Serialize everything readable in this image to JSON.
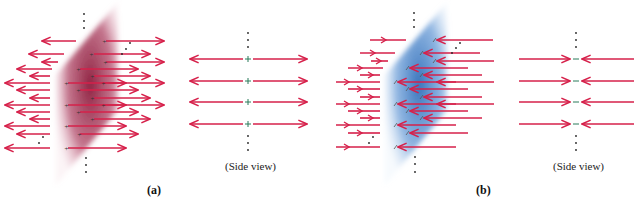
{
  "figure": {
    "panels": [
      {
        "id": "a",
        "label": "(a)",
        "plane_color": "#9b2a4a",
        "charge_symbol": "+",
        "field_direction": "outward",
        "side_view_label": "(Side view)"
      },
      {
        "id": "b",
        "label": "(b)",
        "plane_color": "#4a86c8",
        "charge_symbol": "−",
        "field_direction": "inward",
        "side_view_label": "(Side view)"
      }
    ],
    "arrow_color": "#d6204a",
    "side_view_rows": 4
  }
}
